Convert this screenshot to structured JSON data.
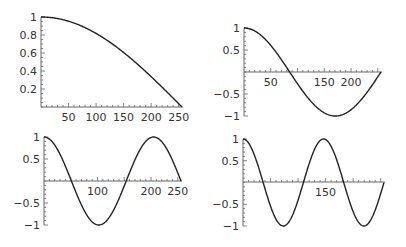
{
  "colors": {
    "line": "#222222",
    "axis": "#666666",
    "text": "#333333",
    "background": "#ffffff"
  },
  "chart_data": [
    {
      "type": "line",
      "title": "",
      "xlabel": "",
      "ylabel": "",
      "function": "cos(1*pi*x/512)",
      "frequency": 1,
      "x_range": [
        0,
        256
      ],
      "ylim": [
        0,
        1
      ],
      "xticks_labeled": [
        50,
        100,
        150,
        200,
        250
      ],
      "yticks_labeled": [
        0.2,
        0.4,
        0.6,
        0.8,
        1
      ],
      "ytick_labels": [
        "0.2",
        "0.4",
        "0.6",
        "0.8",
        "1"
      ],
      "grid": false,
      "sample_points": {
        "x": [
          0,
          50,
          100,
          150,
          200,
          256
        ],
        "y": [
          1.0,
          0.953,
          0.818,
          0.609,
          0.354,
          0.0
        ]
      },
      "layout": {
        "x0": 41,
        "x1": 182,
        "yTop": 17,
        "yBase": 107,
        "axisY": 107
      }
    },
    {
      "type": "line",
      "title": "",
      "xlabel": "",
      "ylabel": "",
      "function": "cos(3*pi*x/512)",
      "frequency": 3,
      "x_range": [
        0,
        256
      ],
      "ylim": [
        -1,
        1
      ],
      "xticks_labeled": [
        50,
        150,
        200
      ],
      "yticks_labeled": [
        -1,
        -0.5,
        0.5,
        1
      ],
      "ytick_labels": [
        "−1",
        "−0.5",
        "0.5",
        "1"
      ],
      "grid": false,
      "sample_points": {
        "x": [
          0,
          85.3,
          170.7,
          256
        ],
        "y": [
          1,
          0,
          -1,
          0
        ]
      },
      "layout": {
        "x0": 244,
        "x1": 381,
        "yTop": 28,
        "yBase": 116,
        "axisY": 72
      }
    },
    {
      "type": "line",
      "title": "",
      "xlabel": "",
      "ylabel": "",
      "function": "cos(5*pi*x/512)",
      "frequency": 5,
      "x_range": [
        0,
        256
      ],
      "ylim": [
        -1,
        1
      ],
      "xticks_labeled": [
        100,
        200,
        250
      ],
      "yticks_labeled": [
        -1,
        -0.5,
        0.5,
        1
      ],
      "ytick_labels": [
        "−1",
        "−0.5",
        "0.5",
        "1"
      ],
      "grid": false,
      "sample_points": {
        "x": [
          0,
          51.2,
          102.4,
          153.6,
          204.8,
          256
        ],
        "y": [
          1,
          0,
          -1,
          0,
          1,
          0
        ]
      },
      "layout": {
        "x0": 44,
        "x1": 181,
        "yTop": 137,
        "yBase": 225,
        "axisY": 181
      }
    },
    {
      "type": "line",
      "title": "",
      "xlabel": "",
      "ylabel": "",
      "function": "cos(7*pi*x/512)",
      "frequency": 7,
      "x_range": [
        0,
        256
      ],
      "ylim": [
        -1,
        1
      ],
      "xticks_labeled": [
        150
      ],
      "yticks_labeled": [
        -1,
        -0.5,
        0.5,
        1
      ],
      "ytick_labels": [
        "−1",
        "−0.5",
        "0.5",
        "1"
      ],
      "grid": false,
      "sample_points": {
        "x": [
          0,
          36.6,
          73.1,
          109.7,
          146.3,
          182.9,
          219.4,
          256
        ],
        "y": [
          1,
          0,
          -1,
          0,
          1,
          0,
          -1,
          0
        ]
      },
      "layout": {
        "x0": 243,
        "x1": 384,
        "yTop": 139,
        "yBase": 226,
        "axisY": 182
      }
    }
  ]
}
